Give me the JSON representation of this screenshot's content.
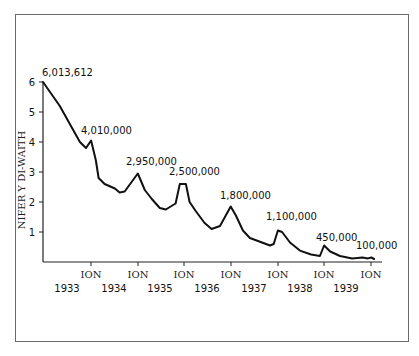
{
  "chart_data": {
    "type": "line",
    "title": "",
    "xlabel": "",
    "ylabel": "NIFER Y DI-WAITH",
    "ylim": [
      0,
      6
    ],
    "y_ticks": [
      "1",
      "2",
      "3",
      "4",
      "5",
      "6"
    ],
    "x_tick_labels": [
      "ION",
      "ION",
      "ION",
      "ION",
      "ION",
      "ION",
      "ION"
    ],
    "year_labels": [
      "1933",
      "1934",
      "1935",
      "1936",
      "1937",
      "1938",
      "1939"
    ],
    "grid": false,
    "legend": null,
    "annotations": [
      {
        "label": "6,013,612",
        "x": "1933 start",
        "value": 6.01
      },
      {
        "label": "4,010,000",
        "x": "ION 1934",
        "value": 4.01
      },
      {
        "label": "2,950,000",
        "x": "ION 1935",
        "value": 2.95
      },
      {
        "label": "2,500,000",
        "x": "ION 1936",
        "value": 2.5
      },
      {
        "label": "1,800,000",
        "x": "ION 1937",
        "value": 1.8
      },
      {
        "label": "1,100,000",
        "x": "ION 1938",
        "value": 1.1
      },
      {
        "label": "450,000",
        "x": "ION 1939",
        "value": 0.45
      },
      {
        "label": "100,000",
        "x": "ION 1940",
        "value": 0.1
      }
    ],
    "series": [
      {
        "name": "Nifer y di-waith (miliynau)",
        "points": [
          [
            0.0,
            6.0
          ],
          [
            0.36,
            5.2
          ],
          [
            0.79,
            4.0
          ],
          [
            0.92,
            3.8
          ],
          [
            1.03,
            4.05
          ],
          [
            1.13,
            3.4
          ],
          [
            1.19,
            2.8
          ],
          [
            1.32,
            2.6
          ],
          [
            1.54,
            2.45
          ],
          [
            1.64,
            2.32
          ],
          [
            1.75,
            2.35
          ],
          [
            2.03,
            2.95
          ],
          [
            2.18,
            2.4
          ],
          [
            2.33,
            2.1
          ],
          [
            2.5,
            1.8
          ],
          [
            2.63,
            1.75
          ],
          [
            2.84,
            1.95
          ],
          [
            2.93,
            2.6
          ],
          [
            3.06,
            2.6
          ],
          [
            3.14,
            2.0
          ],
          [
            3.27,
            1.7
          ],
          [
            3.46,
            1.3
          ],
          [
            3.61,
            1.1
          ],
          [
            3.79,
            1.2
          ],
          [
            4.02,
            1.85
          ],
          [
            4.13,
            1.55
          ],
          [
            4.28,
            1.05
          ],
          [
            4.43,
            0.8
          ],
          [
            4.69,
            0.65
          ],
          [
            4.86,
            0.55
          ],
          [
            4.94,
            0.6
          ],
          [
            5.03,
            1.05
          ],
          [
            5.12,
            1.0
          ],
          [
            5.29,
            0.65
          ],
          [
            5.5,
            0.38
          ],
          [
            5.74,
            0.25
          ],
          [
            5.93,
            0.2
          ],
          [
            6.02,
            0.55
          ],
          [
            6.15,
            0.35
          ],
          [
            6.36,
            0.2
          ],
          [
            6.62,
            0.12
          ],
          [
            6.84,
            0.15
          ],
          [
            6.96,
            0.12
          ],
          [
            7.03,
            0.15
          ],
          [
            7.09,
            0.1
          ]
        ]
      }
    ]
  },
  "axis": {
    "y_label": "NIFER Y DI-WAITH",
    "y_ticks": [
      "1",
      "2",
      "3",
      "4",
      "5",
      "6"
    ],
    "x_tick_label": "ION",
    "years": [
      "1933",
      "1934",
      "1935",
      "1936",
      "1937",
      "1938",
      "1939"
    ]
  },
  "annotations": [
    "6,013,612",
    "4,010,000",
    "2,950,000",
    "2,500,000",
    "1,800,000",
    "1,100,000",
    "450,000",
    "100,000"
  ]
}
